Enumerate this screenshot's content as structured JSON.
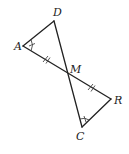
{
  "figure": {
    "type": "geometry",
    "points": {
      "A": {
        "label": "A",
        "x": 23,
        "y": 46,
        "lx": 14,
        "ly": 50
      },
      "D": {
        "label": "D",
        "x": 54,
        "y": 21,
        "lx": 53,
        "ly": 15
      },
      "M": {
        "label": "M",
        "x": 68,
        "y": 75,
        "lx": 71,
        "ly": 73
      },
      "R": {
        "label": "R",
        "x": 111,
        "y": 99,
        "lx": 114,
        "ly": 104
      },
      "C": {
        "label": "C",
        "x": 82,
        "y": 127,
        "lx": 76,
        "ly": 140
      }
    },
    "segments": [
      [
        "A",
        "D"
      ],
      [
        "D",
        "C"
      ],
      [
        "A",
        "R"
      ],
      [
        "R",
        "C"
      ]
    ],
    "congruence_marks": {
      "sides": [
        "AM",
        "MR"
      ],
      "angles": [
        "A",
        "C"
      ]
    },
    "colors": {
      "stroke": "#222222",
      "background": "#ffffff"
    }
  }
}
